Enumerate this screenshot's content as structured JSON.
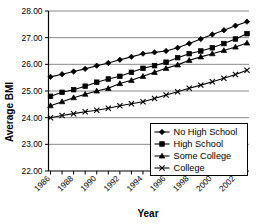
{
  "chart_data": {
    "type": "line",
    "title": "",
    "xlabel": "Year",
    "ylabel": "Average BMI",
    "xlim": [
      1986,
      2003
    ],
    "ylim": [
      22.0,
      28.0
    ],
    "ytick_labels": [
      "28.00",
      "27.00",
      "26.00",
      "25.00",
      "24.00",
      "23.00",
      "22.00"
    ],
    "ytick_values": [
      28.0,
      27.0,
      26.0,
      25.0,
      24.0,
      23.0,
      22.0
    ],
    "grid": "horizontal",
    "legend_position": "lower-right-inside",
    "x": [
      1986,
      1987,
      1988,
      1989,
      1990,
      1991,
      1992,
      1993,
      1994,
      1995,
      1996,
      1997,
      1998,
      1999,
      2000,
      2001,
      2002,
      2003
    ],
    "xtick_labels": [
      "1986",
      "",
      "1988",
      "",
      "1990",
      "",
      "1992",
      "",
      "1994",
      "",
      "1996",
      "",
      "1998",
      "",
      "2000",
      "",
      "2002",
      ""
    ],
    "xtick_labels_shown": [
      "1986",
      "1988",
      "1990",
      "1992",
      "1994",
      "1996",
      "1998",
      "2000",
      "2002"
    ],
    "series": [
      {
        "name": "No High School",
        "marker": "diamond",
        "values": [
          25.53,
          25.63,
          25.73,
          25.83,
          25.95,
          26.05,
          26.17,
          26.28,
          26.4,
          26.45,
          26.5,
          26.62,
          26.78,
          26.95,
          27.12,
          27.28,
          27.45,
          27.6
        ]
      },
      {
        "name": "High School",
        "marker": "square",
        "values": [
          24.8,
          24.95,
          25.05,
          25.18,
          25.33,
          25.45,
          25.55,
          25.7,
          25.85,
          25.95,
          26.08,
          26.25,
          26.4,
          26.5,
          26.62,
          26.78,
          26.95,
          27.15
        ]
      },
      {
        "name": "Some College",
        "marker": "triangle",
        "values": [
          24.45,
          24.6,
          24.75,
          24.88,
          25.0,
          25.1,
          25.28,
          25.4,
          25.55,
          25.7,
          25.85,
          25.98,
          26.15,
          26.28,
          26.4,
          26.52,
          26.65,
          26.8
        ]
      },
      {
        "name": "College",
        "marker": "x",
        "values": [
          24.0,
          24.08,
          24.15,
          24.22,
          24.28,
          24.35,
          24.45,
          24.52,
          24.6,
          24.72,
          24.85,
          24.97,
          25.1,
          25.22,
          25.35,
          25.48,
          25.62,
          25.78
        ]
      }
    ]
  },
  "axis": {
    "y_title": "Average BMI",
    "x_title": "Year"
  },
  "legend": {
    "items": [
      {
        "label": "No High School",
        "marker": "diamond-marker"
      },
      {
        "label": "High School",
        "marker": "square-marker"
      },
      {
        "label": "Some College",
        "marker": "triangle-marker"
      },
      {
        "label": "College",
        "marker": "x-marker"
      }
    ]
  },
  "colors": {
    "line": "#000000",
    "grid": "#7d7d7d",
    "background": "#ffffff"
  }
}
